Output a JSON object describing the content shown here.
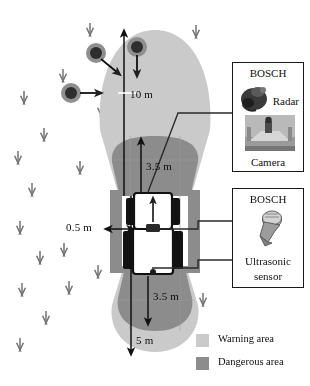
{
  "figure": {
    "colors": {
      "warning_area": "#cacaca",
      "dangerous_area": "#8c8c8c",
      "line": "#1a1a1a",
      "background": "#ffffff",
      "obstacle": "#3a3a3a",
      "crop_marker": "#555555"
    }
  },
  "dimensions": {
    "front_warning": "10 m",
    "front_dangerous": "3.5 m",
    "side_dangerous": "0.5 m",
    "rear_dangerous": "3.5 m",
    "rear_warning": "5 m"
  },
  "sensor_boxes": [
    {
      "id": "radar-camera",
      "brand": "BOSCH",
      "labels": [
        "Radar",
        "Camera"
      ],
      "icons": [
        "radar-sensor-icon",
        "camera-photo-icon"
      ]
    },
    {
      "id": "ultrasonic",
      "brand": "BOSCH",
      "labels": [
        "Ultrasonic",
        "sensor"
      ],
      "icons": [
        "ultrasonic-sensor-icon"
      ]
    }
  ],
  "legend": {
    "items": [
      {
        "label": "Warning area",
        "color": "#cacaca"
      },
      {
        "label": "Dangerous area",
        "color": "#8c8c8c"
      }
    ]
  },
  "scene": {
    "vehicle_name": "tractor-top-view",
    "obstacle_count": 3,
    "crop_marker_count": 22
  }
}
